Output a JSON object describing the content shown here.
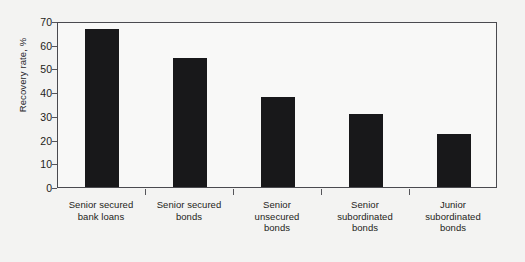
{
  "chart_data": {
    "type": "bar",
    "title": "",
    "xlabel": "",
    "ylabel": "Recovery rate, %",
    "ylim": [
      0,
      70
    ],
    "ytick_step": 10,
    "yticks": [
      "70",
      "60",
      "50",
      "40",
      "30",
      "20",
      "10",
      "0"
    ],
    "ytick_values": [
      70,
      60,
      50,
      40,
      30,
      20,
      10,
      0
    ],
    "grid": false,
    "legend": null,
    "orientation": "vertical",
    "categories": [
      "Senior secured bank loans",
      "Senior secured bonds",
      "Senior unsecured bonds",
      "Senior subordinated bonds",
      "Junior subordinated bonds"
    ],
    "category_lines": [
      [
        "Senior secured",
        "bank loans"
      ],
      [
        "Senior secured",
        "bonds"
      ],
      [
        "Senior",
        "unsecured",
        "bonds"
      ],
      [
        "Senior",
        "subordinated",
        "bonds"
      ],
      [
        "Junior",
        "subordinated",
        "bonds"
      ]
    ],
    "values": [
      66.5,
      54.5,
      38,
      31,
      22.5
    ],
    "bar_color": "#18181a",
    "plot_background": "#f8f8f7",
    "figure_background": "#f3f3f2",
    "axis_color": "#4a4a4f"
  }
}
